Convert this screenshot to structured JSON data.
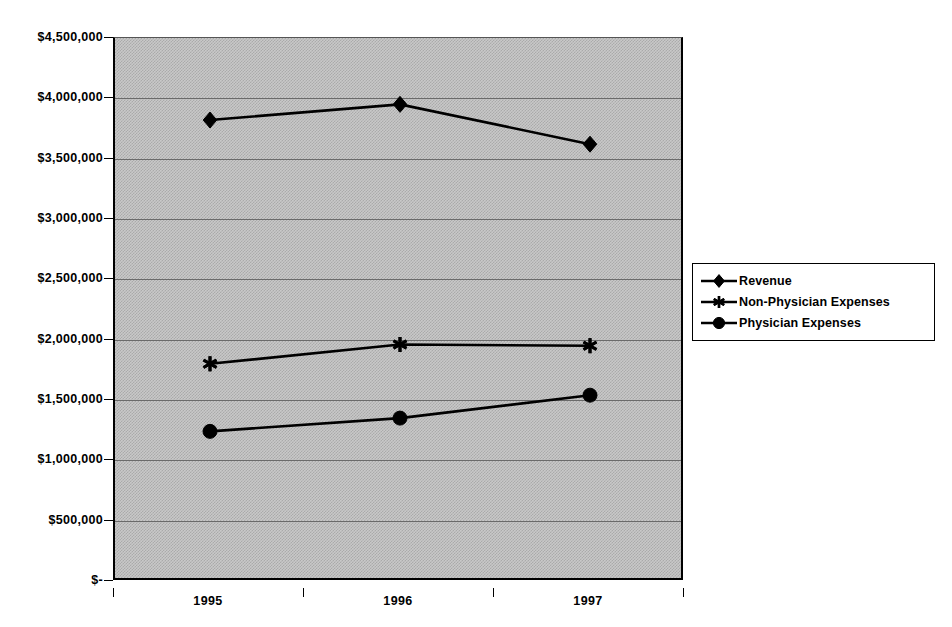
{
  "chart_data": {
    "type": "line",
    "title": "",
    "xlabel": "",
    "ylabel": "",
    "categories": [
      "1995",
      "1996",
      "1997"
    ],
    "ylim": [
      0,
      4500000
    ],
    "ytick_values": [
      4500000,
      4000000,
      3500000,
      3000000,
      2500000,
      2000000,
      1500000,
      1000000,
      500000,
      0
    ],
    "ytick_labels": [
      "$4,500,000",
      "$4,000,000",
      "$3,500,000",
      "$3,000,000",
      "$2,500,000",
      "$2,000,000",
      "$1,500,000",
      "$1,000,000",
      "$500,000",
      "$-"
    ],
    "grid": true,
    "legend_position": "right",
    "series": [
      {
        "name": "Revenue",
        "marker": "diamond",
        "color": "#000000",
        "values": [
          3820000,
          3950000,
          3620000
        ]
      },
      {
        "name": "Non-Physician Expenses",
        "marker": "star",
        "color": "#000000",
        "values": [
          1800000,
          1960000,
          1950000
        ]
      },
      {
        "name": "Physician Expenses",
        "marker": "circle",
        "color": "#000000",
        "values": [
          1240000,
          1350000,
          1540000
        ]
      }
    ]
  },
  "axes": {
    "y_labels": [
      "$4,500,000",
      "$4,000,000",
      "$3,500,000",
      "$3,000,000",
      "$2,500,000",
      "$2,000,000",
      "$1,500,000",
      "$1,000,000",
      "$500,000",
      "$-"
    ],
    "x_labels": [
      "1995",
      "1996",
      "1997"
    ]
  },
  "legend": {
    "items": [
      {
        "label": "Revenue",
        "marker": "diamond"
      },
      {
        "label": "Non-Physician Expenses",
        "marker": "star"
      },
      {
        "label": "Physician Expenses",
        "marker": "circle"
      }
    ]
  },
  "colors": {
    "plot_fill": "#c8c8c8",
    "plot_pattern": "#aaaaaa",
    "gridline": "#6a6a6a",
    "axis": "#000000",
    "series": "#000000",
    "legend_background": "#ffffff"
  }
}
